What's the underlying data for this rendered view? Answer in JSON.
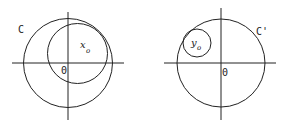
{
  "figures": [
    {
      "id": "left",
      "circle_label": "C",
      "point_label": "x",
      "point_subscript": "o",
      "origin_label": "0"
    },
    {
      "id": "right",
      "circle_label": "C'",
      "point_label": "y",
      "point_subscript": "o",
      "origin_label": "0"
    }
  ],
  "colors": {
    "stroke": "#222222",
    "background": "#ffffff"
  }
}
